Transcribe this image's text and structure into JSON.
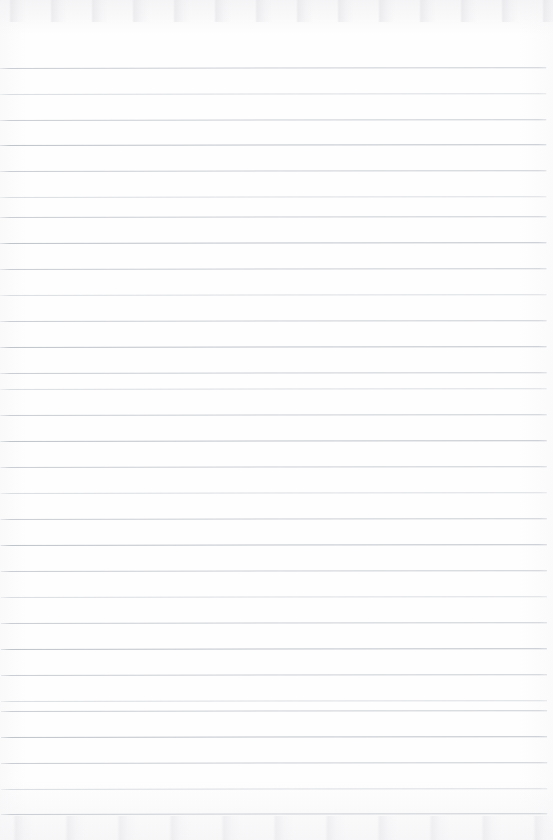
{
  "document": {
    "kind": "scanned-blank-ruled-paper",
    "title": "Blank Ruled Notebook Page",
    "page_width_px": 553,
    "page_height_px": 840,
    "has_text": false,
    "has_handwriting": false,
    "visible_text": "",
    "background_color": "#fefefe",
    "paper_tint_color": "#f4f4f6"
  },
  "ruling": {
    "line_color": "#c6cad0",
    "line_color_faint": "#d2d6db",
    "line_color_strong": "#bcc1c8",
    "line_thickness_px": 1,
    "line_spacing_px": 25.7,
    "first_line_y_px": 68,
    "last_line_y_px": 814,
    "line_start_x_px": 0,
    "line_end_x_px": 546,
    "right_margin_px": 7,
    "line_count": 30,
    "skew_degrees": -0.085,
    "lines": [
      {
        "index": 1,
        "y": 68,
        "weight": "normal"
      },
      {
        "index": 2,
        "y": 94,
        "weight": "faint"
      },
      {
        "index": 3,
        "y": 120,
        "weight": "normal"
      },
      {
        "index": 4,
        "y": 145,
        "weight": "strong"
      },
      {
        "index": 5,
        "y": 171,
        "weight": "normal"
      },
      {
        "index": 6,
        "y": 197,
        "weight": "faint"
      },
      {
        "index": 7,
        "y": 217,
        "weight": "normal"
      },
      {
        "index": 8,
        "y": 243,
        "weight": "strong"
      },
      {
        "index": 9,
        "y": 269,
        "weight": "normal"
      },
      {
        "index": 10,
        "y": 295,
        "weight": "faint"
      },
      {
        "index": 11,
        "y": 321,
        "weight": "normal"
      },
      {
        "index": 12,
        "y": 347,
        "weight": "strong"
      },
      {
        "index": 13,
        "y": 373,
        "weight": "normal"
      },
      {
        "index": 14,
        "y": 389,
        "weight": "faint"
      },
      {
        "index": 15,
        "y": 415,
        "weight": "normal"
      },
      {
        "index": 16,
        "y": 441,
        "weight": "strong"
      },
      {
        "index": 17,
        "y": 467,
        "weight": "normal"
      },
      {
        "index": 18,
        "y": 493,
        "weight": "faint"
      },
      {
        "index": 19,
        "y": 519,
        "weight": "normal"
      },
      {
        "index": 20,
        "y": 545,
        "weight": "strong"
      },
      {
        "index": 21,
        "y": 571,
        "weight": "normal"
      },
      {
        "index": 22,
        "y": 597,
        "weight": "faint"
      },
      {
        "index": 23,
        "y": 623,
        "weight": "normal"
      },
      {
        "index": 24,
        "y": 649,
        "weight": "strong"
      },
      {
        "index": 25,
        "y": 675,
        "weight": "normal"
      },
      {
        "index": 26,
        "y": 701,
        "weight": "faint"
      },
      {
        "index": 27,
        "y": 711,
        "weight": "normal"
      },
      {
        "index": 28,
        "y": 737,
        "weight": "strong"
      },
      {
        "index": 29,
        "y": 763,
        "weight": "normal"
      },
      {
        "index": 30,
        "y": 789,
        "weight": "faint"
      },
      {
        "index": 31,
        "y": 814,
        "weight": "normal"
      }
    ]
  }
}
